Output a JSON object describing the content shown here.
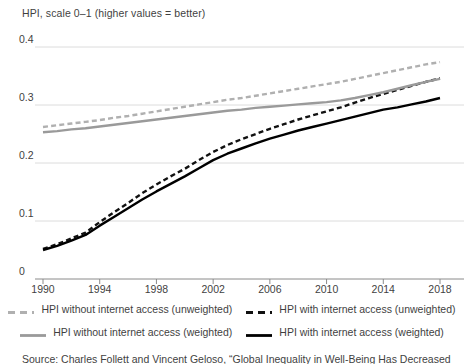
{
  "chart_data": {
    "type": "line",
    "title": "HPI, scale 0–1 (higher values = better)",
    "xlabel": "",
    "ylabel": "HPI, scale 0–1 (higher values = better)",
    "xlim": [
      1990,
      2018
    ],
    "ylim": [
      0,
      0.4
    ],
    "grid": true,
    "legend_position": "bottom",
    "ytick_labels": [
      "0",
      "0.1",
      "0.2",
      "0.3",
      "0.4"
    ],
    "ytick_values": [
      0,
      0.1,
      0.2,
      0.3,
      0.4
    ],
    "xtick_labels": [
      "1990",
      "1994",
      "1998",
      "2002",
      "2006",
      "2010",
      "2014",
      "2018"
    ],
    "xtick_values": [
      1990,
      1994,
      1998,
      2002,
      2006,
      2010,
      2014,
      2018
    ],
    "x": [
      1990,
      1991,
      1992,
      1993,
      1994,
      1995,
      1996,
      1997,
      1998,
      1999,
      2000,
      2001,
      2002,
      2003,
      2004,
      2005,
      2006,
      2007,
      2008,
      2009,
      2010,
      2011,
      2012,
      2013,
      2014,
      2015,
      2016,
      2017,
      2018
    ],
    "series": [
      {
        "name": "HPI without internet access (unweighted)",
        "color": "#b0b0b0",
        "style": "dashed",
        "values": [
          0.262,
          0.265,
          0.268,
          0.271,
          0.274,
          0.278,
          0.281,
          0.285,
          0.289,
          0.293,
          0.297,
          0.301,
          0.305,
          0.309,
          0.312,
          0.316,
          0.32,
          0.324,
          0.328,
          0.332,
          0.336,
          0.34,
          0.345,
          0.35,
          0.355,
          0.36,
          0.365,
          0.37,
          0.374
        ]
      },
      {
        "name": "HPI with internet access (unweighted)",
        "color": "#111111",
        "style": "dashed",
        "values": [
          0.052,
          0.06,
          0.07,
          0.08,
          0.098,
          0.115,
          0.131,
          0.148,
          0.163,
          0.177,
          0.19,
          0.205,
          0.219,
          0.231,
          0.241,
          0.25,
          0.259,
          0.267,
          0.275,
          0.282,
          0.289,
          0.296,
          0.304,
          0.312,
          0.319,
          0.326,
          0.333,
          0.34,
          0.346
        ]
      },
      {
        "name": "HPI without internet access (weighted)",
        "color": "#9a9a9a",
        "style": "solid",
        "values": [
          0.253,
          0.255,
          0.258,
          0.26,
          0.263,
          0.266,
          0.269,
          0.272,
          0.275,
          0.278,
          0.281,
          0.284,
          0.287,
          0.29,
          0.292,
          0.295,
          0.297,
          0.299,
          0.301,
          0.303,
          0.305,
          0.308,
          0.312,
          0.317,
          0.322,
          0.328,
          0.334,
          0.34,
          0.345
        ]
      },
      {
        "name": "HPI with internet access (weighted)",
        "color": "#000000",
        "style": "solid",
        "values": [
          0.05,
          0.057,
          0.066,
          0.076,
          0.092,
          0.107,
          0.122,
          0.137,
          0.151,
          0.164,
          0.177,
          0.191,
          0.205,
          0.216,
          0.225,
          0.234,
          0.242,
          0.249,
          0.256,
          0.262,
          0.268,
          0.274,
          0.28,
          0.286,
          0.292,
          0.296,
          0.301,
          0.306,
          0.312
        ]
      }
    ]
  },
  "legend": {
    "rows": [
      [
        {
          "label": "HPI without internet access (unweighted)",
          "color": "#b0b0b0",
          "style": "dashed"
        },
        {
          "label": "HPI with internet access (unweighted)",
          "color": "#111111",
          "style": "dashed"
        }
      ],
      [
        {
          "label": "HPI without internet access (weighted)",
          "color": "#9a9a9a",
          "style": "solid"
        },
        {
          "label": "HPI with internet access (weighted)",
          "color": "#000000",
          "style": "solid"
        }
      ]
    ]
  },
  "source_note": "Source: Charles Follett and Vincent Geloso, “Global Inequality in Well-Being Has Decreased"
}
